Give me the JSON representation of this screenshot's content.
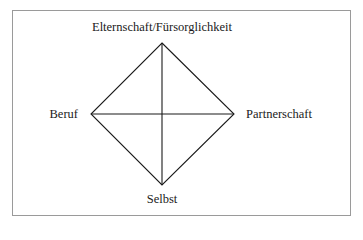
{
  "diagram": {
    "type": "diamond-quadrant",
    "nodes": {
      "top": "Elternschaft/Fürsorglichkeit",
      "left": "Beruf",
      "right": "Partnerschaft",
      "bottom": "Selbst"
    },
    "colors": {
      "line": "#1a1a1a",
      "frame": "#9a9a9a",
      "background": "#ffffff"
    }
  }
}
